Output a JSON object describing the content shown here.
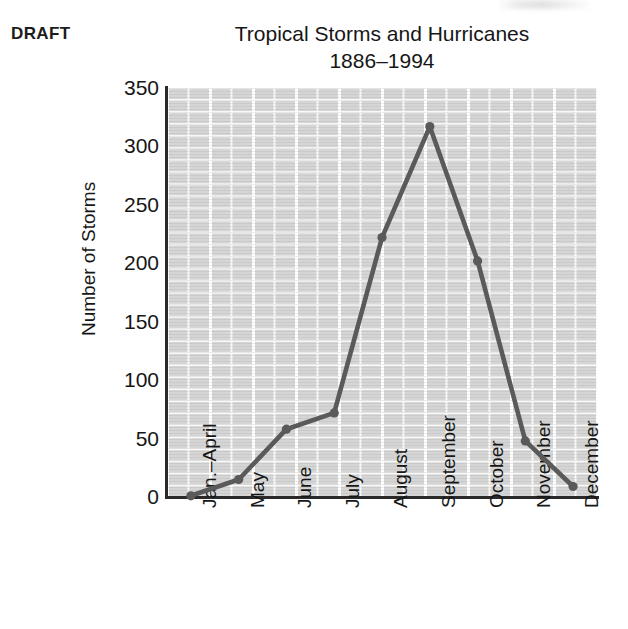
{
  "stamp": {
    "label": "DRAFT"
  },
  "chart_data": {
    "type": "line",
    "title": "Tropical Storms and Hurricanes",
    "subtitle": "1886–1994",
    "xlabel": "",
    "ylabel": "Number of Storms",
    "categories": [
      "Jan.–April",
      "May",
      "June",
      "July",
      "August",
      "September",
      "October",
      "November",
      "December"
    ],
    "values": [
      1,
      15,
      58,
      72,
      222,
      317,
      202,
      48,
      9
    ],
    "series": [
      {
        "name": "Number of Storms",
        "values": [
          1,
          15,
          58,
          72,
          222,
          317,
          202,
          48,
          9
        ]
      }
    ],
    "ylim": [
      0,
      350
    ],
    "yticks": [
      0,
      50,
      100,
      150,
      200,
      250,
      300,
      350
    ],
    "ytick_labels": [
      "0",
      "50",
      "100",
      "150",
      "200",
      "250",
      "300",
      "350"
    ],
    "grid": true,
    "legend": "none",
    "line_color": "#5a5a5a",
    "marker": "circle",
    "marker_color": "#5a5a5a",
    "plot_background": "#d5d5d5",
    "gridline_color": "#ffffff",
    "axis_color": "#2a2a2a",
    "text_color": "#161616"
  }
}
